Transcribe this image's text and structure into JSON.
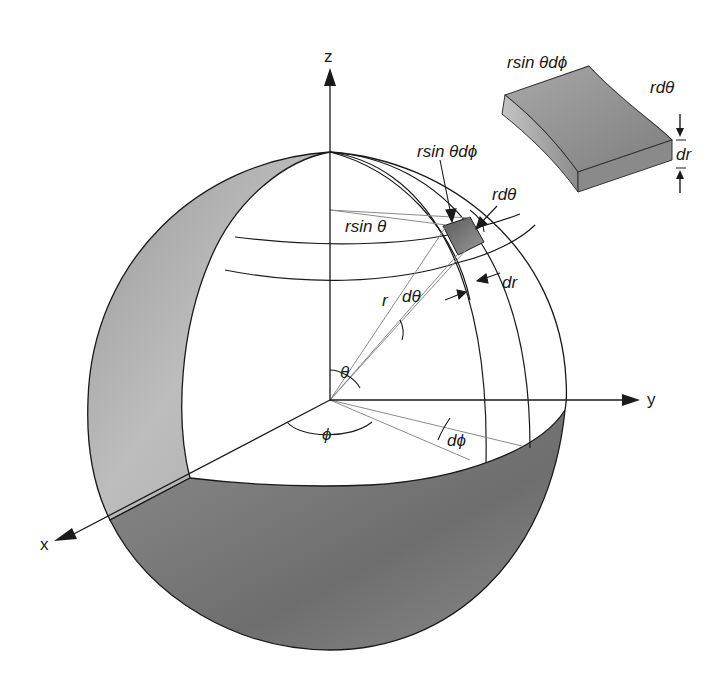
{
  "figure": {
    "axes": {
      "z": "z",
      "y": "y",
      "x": "x"
    },
    "labels": {
      "r_sin_theta": "rsin θ",
      "r": "r",
      "d_theta": "dθ",
      "theta": "θ",
      "phi": "ϕ",
      "d_phi": "dϕ",
      "r_sin_theta_dphi": "rsin θdϕ",
      "r_dtheta": "rdθ",
      "dr": "dr"
    },
    "inset": {
      "top_edge": "rsin θdϕ",
      "side_edge": "rdθ",
      "thickness": "dr"
    },
    "colors": {
      "line": "#1a1a1a",
      "shade_light": "#b4b4b4",
      "shade_dark": "#7a7a7a",
      "thin_line": "#8a8a8a"
    }
  }
}
